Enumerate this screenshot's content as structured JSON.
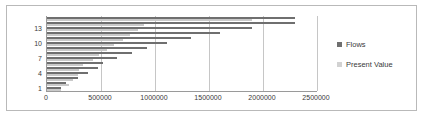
{
  "chart_data": {
    "type": "bar",
    "orientation": "horizontal",
    "title": "",
    "xlabel": "",
    "ylabel": "",
    "xlim": [
      0,
      2500000
    ],
    "ylim": [
      0,
      16
    ],
    "grid": true,
    "legend_position": "right",
    "x_ticks": [
      0,
      500000,
      1000000,
      1500000,
      2000000,
      2500000
    ],
    "x_tick_labels": [
      "0",
      "500000",
      "1000000",
      "1500000",
      "2000000",
      "2500000"
    ],
    "categories": [
      "1",
      "2",
      "3",
      "4",
      "5",
      "6",
      "7",
      "8",
      "9",
      "10",
      "11",
      "12",
      "13",
      "14",
      "15"
    ],
    "y_tick_labels": [
      "1",
      "4",
      "7",
      "10",
      "13"
    ],
    "series": [
      {
        "name": "Flows",
        "color": "#6f6f6f",
        "values": [
          130000,
          175000,
          290000,
          380000,
          470000,
          520000,
          650000,
          790000,
          930000,
          1110000,
          1330000,
          1600000,
          1900000,
          2300000,
          2300000
        ]
      },
      {
        "name": "Present Value",
        "color": "#c9c9c9",
        "values": [
          125000,
          200000,
          245000,
          285000,
          300000,
          330000,
          430000,
          480000,
          560000,
          620000,
          700000,
          770000,
          840000,
          900000,
          1900000
        ]
      }
    ]
  },
  "legend": {
    "items": [
      {
        "label": "Flows",
        "marker": "square-marker",
        "color": "#6f6f6f"
      },
      {
        "label": "Present Value",
        "marker": "square-marker",
        "color": "#c9c9c9"
      }
    ]
  }
}
